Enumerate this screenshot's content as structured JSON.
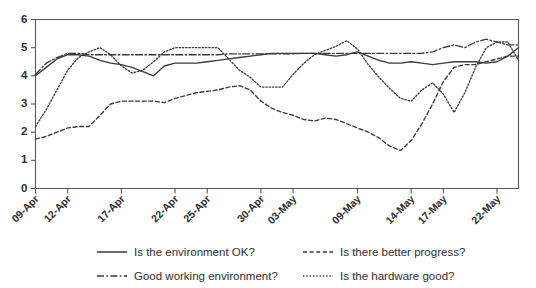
{
  "chart_data": {
    "type": "line",
    "title": "",
    "subtitle": "",
    "xlabel": "",
    "ylabel": "",
    "ylim": [
      0,
      6
    ],
    "yticks": [
      0,
      1,
      2,
      3,
      4,
      5,
      6
    ],
    "grid": false,
    "legend_position": "bottom",
    "x": [
      "09-Apr",
      "10-Apr",
      "11-Apr",
      "12-Apr",
      "13-Apr",
      "14-Apr",
      "15-Apr",
      "16-Apr",
      "17-Apr",
      "18-Apr",
      "19-Apr",
      "20-Apr",
      "21-Apr",
      "22-Apr",
      "23-Apr",
      "24-Apr",
      "25-Apr",
      "26-Apr",
      "27-Apr",
      "28-Apr",
      "29-Apr",
      "30-Apr",
      "01-May",
      "02-May",
      "03-May",
      "04-May",
      "05-May",
      "06-May",
      "07-May",
      "08-May",
      "09-May",
      "10-May",
      "11-May",
      "12-May",
      "13-May",
      "14-May",
      "15-May",
      "16-May",
      "17-May",
      "18-May",
      "19-May",
      "20-May",
      "21-May",
      "22-May",
      "23-May",
      "24-May"
    ],
    "xtick_labels": [
      "09-Apr",
      "12-Apr",
      "17-Apr",
      "22-Apr",
      "25-Apr",
      "30-Apr",
      "03-May",
      "09-May",
      "14-May",
      "17-May",
      "22-May"
    ],
    "xtick_indices": [
      0,
      3,
      8,
      13,
      16,
      21,
      24,
      30,
      35,
      38,
      43
    ],
    "series": [
      {
        "name": "Is the environment OK?",
        "style": "solid",
        "values": [
          4.0,
          4.3,
          4.6,
          4.75,
          4.75,
          4.7,
          4.55,
          4.45,
          4.4,
          4.3,
          4.15,
          4.0,
          4.35,
          4.45,
          4.45,
          4.45,
          4.5,
          4.55,
          4.6,
          4.65,
          4.7,
          4.75,
          4.8,
          4.8,
          4.8,
          4.8,
          4.8,
          4.75,
          4.7,
          4.75,
          4.85,
          4.7,
          4.55,
          4.45,
          4.45,
          4.5,
          4.45,
          4.4,
          4.45,
          4.5,
          4.5,
          4.5,
          4.45,
          4.5,
          4.7,
          5.0
        ]
      },
      {
        "name": "Good working environment?",
        "style": "dashdot",
        "values": [
          4.05,
          4.45,
          4.65,
          4.8,
          4.8,
          4.75,
          4.75,
          4.75,
          4.75,
          4.75,
          4.75,
          4.75,
          4.75,
          4.75,
          4.75,
          4.75,
          4.75,
          4.75,
          4.78,
          4.78,
          4.78,
          4.78,
          4.78,
          4.78,
          4.78,
          4.8,
          4.8,
          4.8,
          4.8,
          4.8,
          4.8,
          4.8,
          4.8,
          4.8,
          4.8,
          4.8,
          4.8,
          4.85,
          5.0,
          5.1,
          5.0,
          5.2,
          5.3,
          5.2,
          5.1,
          5.1
        ]
      },
      {
        "name": "Is there better progress?",
        "style": "dashed",
        "values": [
          1.75,
          1.85,
          2.0,
          2.15,
          2.2,
          2.2,
          2.6,
          3.0,
          3.1,
          3.1,
          3.1,
          3.1,
          3.05,
          3.2,
          3.3,
          3.4,
          3.45,
          3.5,
          3.6,
          3.65,
          3.5,
          3.1,
          2.85,
          2.7,
          2.6,
          2.45,
          2.4,
          2.5,
          2.45,
          2.3,
          2.15,
          2.0,
          1.8,
          1.5,
          1.35,
          1.7,
          2.3,
          3.0,
          3.8,
          4.3,
          4.4,
          4.4,
          4.5,
          4.6,
          4.7,
          4.7
        ]
      },
      {
        "name": "Is the hardware good?",
        "style": "dotted",
        "values": [
          2.2,
          2.8,
          3.5,
          4.2,
          4.65,
          4.85,
          5.0,
          4.75,
          4.35,
          4.1,
          4.2,
          4.5,
          4.85,
          5.0,
          5.0,
          5.0,
          5.0,
          5.0,
          4.6,
          4.2,
          3.95,
          3.6,
          3.6,
          3.6,
          4.05,
          4.45,
          4.75,
          4.9,
          5.05,
          5.25,
          4.95,
          4.4,
          3.95,
          3.55,
          3.2,
          3.1,
          3.5,
          3.75,
          3.35,
          2.7,
          3.4,
          4.3,
          5.0,
          5.2,
          5.2,
          4.55
        ]
      }
    ]
  },
  "legend": {
    "items": [
      {
        "label": "Is the environment OK?",
        "style": "solid"
      },
      {
        "label": "Good working environment?",
        "style": "dashdot"
      },
      {
        "label": "Is there better progress?",
        "style": "dashed"
      },
      {
        "label": "Is the hardware good?",
        "style": "dotted"
      }
    ]
  }
}
